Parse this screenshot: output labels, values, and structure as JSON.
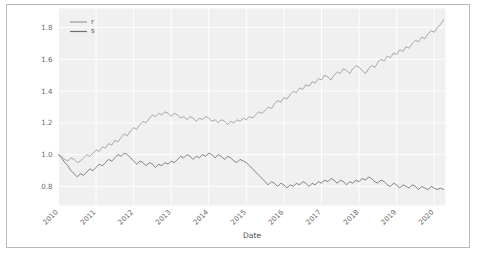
{
  "chart_data": {
    "type": "line",
    "title": "",
    "xlabel": "Date",
    "ylabel": "",
    "grid": true,
    "legend_position": "upper left",
    "background": "#f0f0f0",
    "xlim": [
      2010.0,
      2020.3
    ],
    "ylim": [
      0.68,
      1.92
    ],
    "xticks": [
      "2010",
      "2011",
      "2012",
      "2013",
      "2014",
      "2015",
      "2016",
      "2017",
      "2018",
      "2019",
      "2020"
    ],
    "xtick_values": [
      2010,
      2011,
      2012,
      2013,
      2014,
      2015,
      2016,
      2017,
      2018,
      2019,
      2020
    ],
    "xtick_rotation": 45,
    "yticks": [
      "0.8",
      "1.0",
      "1.2",
      "1.4",
      "1.6",
      "1.8"
    ],
    "ytick_values": [
      0.8,
      1.0,
      1.2,
      1.4,
      1.6,
      1.8
    ],
    "series": [
      {
        "name": "r",
        "color": "#9a9a9a",
        "x": [
          2010.0,
          2010.08,
          2010.17,
          2010.25,
          2010.33,
          2010.42,
          2010.5,
          2010.58,
          2010.67,
          2010.75,
          2010.83,
          2010.92,
          2011.0,
          2011.08,
          2011.17,
          2011.25,
          2011.33,
          2011.42,
          2011.5,
          2011.58,
          2011.67,
          2011.75,
          2011.83,
          2011.92,
          2012.0,
          2012.08,
          2012.17,
          2012.25,
          2012.33,
          2012.42,
          2012.5,
          2012.58,
          2012.67,
          2012.75,
          2012.83,
          2012.92,
          2013.0,
          2013.08,
          2013.17,
          2013.25,
          2013.33,
          2013.42,
          2013.5,
          2013.58,
          2013.67,
          2013.75,
          2013.83,
          2013.92,
          2014.0,
          2014.08,
          2014.17,
          2014.25,
          2014.33,
          2014.42,
          2014.5,
          2014.58,
          2014.67,
          2014.75,
          2014.83,
          2014.92,
          2015.0,
          2015.08,
          2015.17,
          2015.25,
          2015.33,
          2015.42,
          2015.5,
          2015.58,
          2015.67,
          2015.75,
          2015.83,
          2015.92,
          2016.0,
          2016.08,
          2016.17,
          2016.25,
          2016.33,
          2016.42,
          2016.5,
          2016.58,
          2016.67,
          2016.75,
          2016.83,
          2016.92,
          2017.0,
          2017.08,
          2017.17,
          2017.25,
          2017.33,
          2017.42,
          2017.5,
          2017.58,
          2017.67,
          2017.75,
          2017.83,
          2017.92,
          2018.0,
          2018.08,
          2018.17,
          2018.25,
          2018.33,
          2018.42,
          2018.5,
          2018.58,
          2018.67,
          2018.75,
          2018.83,
          2018.92,
          2019.0,
          2019.08,
          2019.17,
          2019.25,
          2019.33,
          2019.42,
          2019.5,
          2019.58,
          2019.67,
          2019.75,
          2019.83,
          2019.92,
          2020.0,
          2020.08,
          2020.17,
          2020.25
        ],
        "values": [
          1.0,
          0.99,
          0.97,
          0.96,
          0.98,
          0.97,
          0.95,
          0.96,
          0.98,
          1.0,
          0.99,
          1.01,
          1.03,
          1.02,
          1.05,
          1.04,
          1.07,
          1.06,
          1.09,
          1.08,
          1.11,
          1.13,
          1.12,
          1.15,
          1.17,
          1.16,
          1.19,
          1.21,
          1.2,
          1.23,
          1.25,
          1.24,
          1.26,
          1.25,
          1.27,
          1.26,
          1.24,
          1.26,
          1.25,
          1.23,
          1.24,
          1.22,
          1.24,
          1.23,
          1.21,
          1.23,
          1.22,
          1.24,
          1.23,
          1.21,
          1.22,
          1.2,
          1.22,
          1.21,
          1.19,
          1.21,
          1.2,
          1.22,
          1.21,
          1.23,
          1.22,
          1.24,
          1.23,
          1.25,
          1.27,
          1.26,
          1.28,
          1.3,
          1.29,
          1.32,
          1.34,
          1.33,
          1.36,
          1.35,
          1.38,
          1.4,
          1.39,
          1.42,
          1.41,
          1.44,
          1.43,
          1.46,
          1.45,
          1.48,
          1.47,
          1.5,
          1.49,
          1.47,
          1.5,
          1.52,
          1.51,
          1.54,
          1.53,
          1.51,
          1.54,
          1.56,
          1.55,
          1.53,
          1.51,
          1.54,
          1.56,
          1.55,
          1.58,
          1.6,
          1.59,
          1.62,
          1.61,
          1.64,
          1.63,
          1.66,
          1.65,
          1.68,
          1.67,
          1.7,
          1.72,
          1.71,
          1.74,
          1.73,
          1.76,
          1.78,
          1.77,
          1.8,
          1.82,
          1.85
        ]
      },
      {
        "name": "s",
        "color": "#6e6e6e",
        "x": [
          2010.0,
          2010.08,
          2010.17,
          2010.25,
          2010.33,
          2010.42,
          2010.5,
          2010.58,
          2010.67,
          2010.75,
          2010.83,
          2010.92,
          2011.0,
          2011.08,
          2011.17,
          2011.25,
          2011.33,
          2011.42,
          2011.5,
          2011.58,
          2011.67,
          2011.75,
          2011.83,
          2011.92,
          2012.0,
          2012.08,
          2012.17,
          2012.25,
          2012.33,
          2012.42,
          2012.5,
          2012.58,
          2012.67,
          2012.75,
          2012.83,
          2012.92,
          2013.0,
          2013.08,
          2013.17,
          2013.25,
          2013.33,
          2013.42,
          2013.5,
          2013.58,
          2013.67,
          2013.75,
          2013.83,
          2013.92,
          2014.0,
          2014.08,
          2014.17,
          2014.25,
          2014.33,
          2014.42,
          2014.5,
          2014.58,
          2014.67,
          2014.75,
          2014.83,
          2014.92,
          2015.0,
          2015.08,
          2015.17,
          2015.25,
          2015.33,
          2015.42,
          2015.5,
          2015.58,
          2015.67,
          2015.75,
          2015.83,
          2015.92,
          2016.0,
          2016.08,
          2016.17,
          2016.25,
          2016.33,
          2016.42,
          2016.5,
          2016.58,
          2016.67,
          2016.75,
          2016.83,
          2016.92,
          2017.0,
          2017.08,
          2017.17,
          2017.25,
          2017.33,
          2017.42,
          2017.5,
          2017.58,
          2017.67,
          2017.75,
          2017.83,
          2017.92,
          2018.0,
          2018.08,
          2018.17,
          2018.25,
          2018.33,
          2018.42,
          2018.5,
          2018.58,
          2018.67,
          2018.75,
          2018.83,
          2018.92,
          2019.0,
          2019.08,
          2019.17,
          2019.25,
          2019.33,
          2019.42,
          2019.5,
          2019.58,
          2019.67,
          2019.75,
          2019.83,
          2019.92,
          2020.0,
          2020.08,
          2020.17,
          2020.25
        ],
        "values": [
          1.0,
          0.98,
          0.95,
          0.93,
          0.9,
          0.88,
          0.86,
          0.88,
          0.87,
          0.89,
          0.91,
          0.9,
          0.92,
          0.94,
          0.93,
          0.95,
          0.97,
          0.96,
          0.98,
          1.0,
          0.99,
          1.01,
          1.0,
          0.98,
          0.96,
          0.94,
          0.96,
          0.95,
          0.93,
          0.95,
          0.94,
          0.92,
          0.94,
          0.93,
          0.95,
          0.94,
          0.96,
          0.95,
          0.97,
          0.99,
          0.98,
          1.0,
          0.99,
          0.97,
          0.99,
          0.98,
          1.0,
          0.99,
          1.01,
          1.0,
          0.98,
          1.0,
          0.99,
          0.97,
          0.99,
          0.98,
          0.96,
          0.95,
          0.97,
          0.96,
          0.95,
          0.93,
          0.91,
          0.89,
          0.87,
          0.85,
          0.83,
          0.81,
          0.83,
          0.82,
          0.8,
          0.82,
          0.81,
          0.79,
          0.81,
          0.8,
          0.82,
          0.81,
          0.83,
          0.82,
          0.8,
          0.82,
          0.81,
          0.83,
          0.82,
          0.84,
          0.83,
          0.85,
          0.84,
          0.82,
          0.84,
          0.83,
          0.81,
          0.83,
          0.82,
          0.84,
          0.83,
          0.85,
          0.84,
          0.86,
          0.85,
          0.83,
          0.82,
          0.84,
          0.83,
          0.81,
          0.8,
          0.82,
          0.81,
          0.79,
          0.81,
          0.8,
          0.79,
          0.81,
          0.8,
          0.78,
          0.8,
          0.79,
          0.78,
          0.8,
          0.79,
          0.78,
          0.79,
          0.78
        ]
      }
    ]
  }
}
